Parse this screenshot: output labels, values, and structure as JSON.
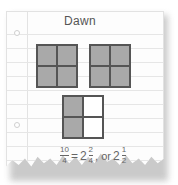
{
  "title": "Dawn",
  "squares": [
    {
      "cells": [
        1,
        1,
        1,
        1
      ]
    },
    {
      "cells": [
        1,
        1,
        1,
        1
      ]
    },
    {
      "cells": [
        1,
        0,
        1,
        0
      ]
    }
  ],
  "equation": {
    "lhs_num": "10",
    "lhs_den": "4",
    "equals": "=",
    "whole1": "2",
    "num1": "2",
    "den1": "4",
    "connector": ", or",
    "whole2": "2",
    "num2": "1",
    "den2": "2"
  },
  "colors": {
    "shaded": "#a9a9a9",
    "unshaded": "#ffffff",
    "grid_line": "#555555"
  }
}
